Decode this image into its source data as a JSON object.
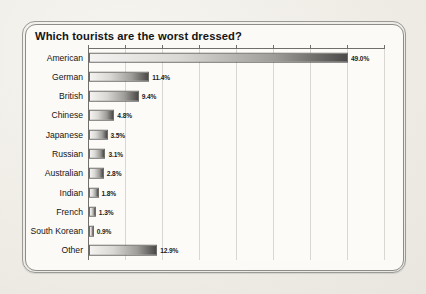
{
  "chart_data": {
    "type": "bar",
    "orientation": "horizontal",
    "title": "Which tourists are the worst dressed?",
    "xlabel": "",
    "ylabel": "",
    "xlim": [
      0,
      56
    ],
    "grid": true,
    "gridline_values": [
      0,
      7,
      14,
      21,
      28,
      35,
      42,
      49,
      56
    ],
    "legend": "none",
    "value_suffix": "%",
    "categories": [
      "American",
      "German",
      "British",
      "Chinese",
      "Japanese",
      "Russian",
      "Australian",
      "Indian",
      "French",
      "South Korean",
      "Other"
    ],
    "values": [
      49.0,
      11.4,
      9.4,
      4.8,
      3.5,
      3.1,
      2.8,
      1.8,
      1.3,
      0.9,
      12.9
    ],
    "labels": [
      "49.0%",
      "11.4%",
      "9.4%",
      "4.8%",
      "3.5%",
      "3.1%",
      "2.8%",
      "1.8%",
      "1.3%",
      "0.9%",
      "12.9%"
    ]
  },
  "colors": {
    "page_background": "#f1efe9",
    "panel_background": "#fbfaf7",
    "frame_border": "#8d8d88",
    "axis": "#6f6f6b",
    "gridline": "#d9d7d1",
    "bar_light": "#f4f3f1",
    "bar_dark": "#4b4a48",
    "text": "#141414"
  }
}
